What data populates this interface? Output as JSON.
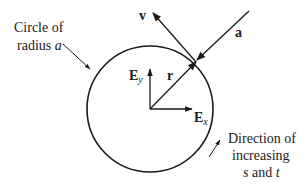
{
  "diagram": {
    "circle_label_line1": "Circle of",
    "circle_label_line2_prefix": "radius ",
    "circle_label_var": "a",
    "vector_v": "v",
    "vector_a": "a",
    "vector_r": "r",
    "basis_ey_main": "E",
    "basis_ey_sub": "y",
    "basis_ex_main": "E",
    "basis_ex_sub": "x",
    "direction_line1": "Direction of",
    "direction_line2": "increasing",
    "direction_var_s": "s",
    "direction_and": " and ",
    "direction_var_t": "t"
  }
}
